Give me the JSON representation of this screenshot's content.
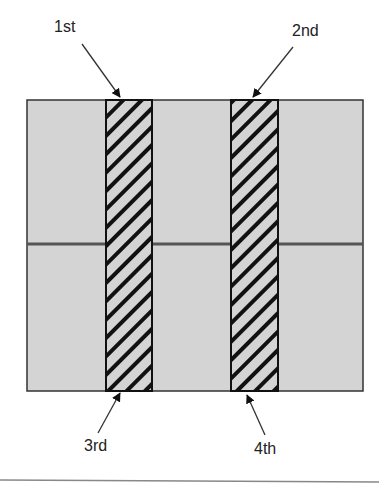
{
  "labels": {
    "first": "1st",
    "second": "2nd",
    "third": "3rd",
    "fourth": "4th"
  },
  "colors": {
    "panel_fill": "#d4d4d4",
    "stroke": "#1a1a1a",
    "hatch": "#111111",
    "rule": "#888888"
  }
}
